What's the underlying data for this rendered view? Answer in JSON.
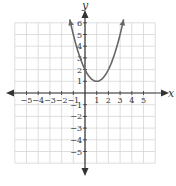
{
  "chart_data": {
    "type": "line",
    "title": "",
    "xlabel": "x",
    "ylabel": "y",
    "xlim": [
      -6,
      6
    ],
    "ylim": [
      -6,
      6
    ],
    "grid": true,
    "x_ticks": [
      -5,
      -4,
      -3,
      -2,
      -1,
      1,
      2,
      3,
      4,
      5
    ],
    "y_ticks": [
      -5,
      -4,
      -3,
      -2,
      -1,
      1,
      2,
      3,
      4,
      5,
      6
    ],
    "x_tick_labels": [
      "−5",
      "−4",
      "−3",
      "−2",
      "−1",
      "1",
      "2",
      "3",
      "4",
      "5"
    ],
    "y_tick_labels": [
      "−5",
      "−4",
      "−3",
      "−2",
      "−1",
      "1",
      "2",
      "3",
      "4",
      "5",
      "6"
    ],
    "series": [
      {
        "name": "f(x) = (x − 1)² + 1",
        "function": "(x-1)^2+1",
        "vertex": [
          1,
          1
        ],
        "y_intercept": 2,
        "x_range": [
          -1.3,
          3.3
        ],
        "arrows": "both",
        "color": "#666666"
      }
    ]
  }
}
